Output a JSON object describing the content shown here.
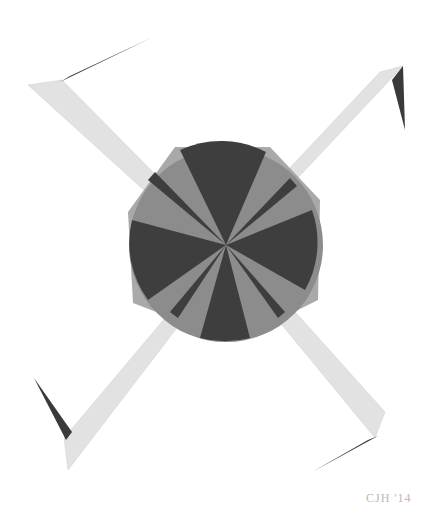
{
  "artwork": {
    "subject": "geometric pinwheel drawing",
    "colors": {
      "background": "#ffffff",
      "dark": "#3e3e3e",
      "mid": "#8a8a8a",
      "light": "#e4e4e4",
      "square": "#9a9a9a"
    }
  },
  "signature": {
    "text": "CJH '14"
  }
}
